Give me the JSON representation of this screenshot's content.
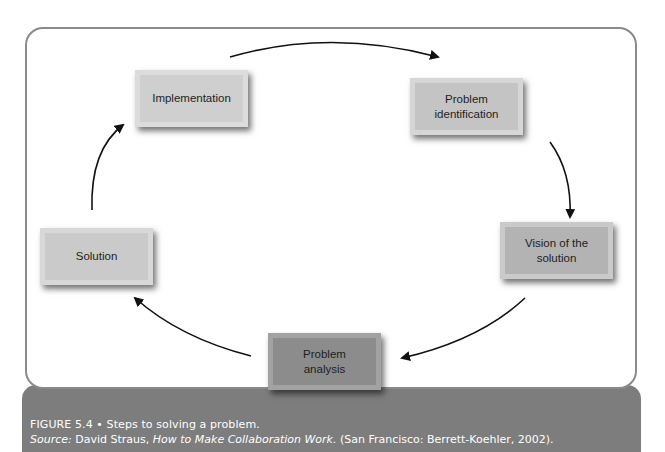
{
  "diagram": {
    "type": "cycle",
    "steps": [
      {
        "id": "problem-identification",
        "label": "Problem identification",
        "lines": [
          "Problem",
          "identification"
        ]
      },
      {
        "id": "vision",
        "label": "Vision of the solution",
        "lines": [
          "Vision of the",
          "solution"
        ]
      },
      {
        "id": "problem-analysis",
        "label": "Problem analysis",
        "lines": [
          "Problem",
          "analysis"
        ]
      },
      {
        "id": "solution",
        "label": "Solution",
        "lines": [
          "Solution"
        ]
      },
      {
        "id": "implementation",
        "label": "Implementation",
        "lines": [
          "Implementation"
        ]
      }
    ],
    "edges": [
      {
        "from": "implementation",
        "to": "problem-identification"
      },
      {
        "from": "problem-identification",
        "to": "vision"
      },
      {
        "from": "vision",
        "to": "problem-analysis"
      },
      {
        "from": "problem-analysis",
        "to": "solution"
      },
      {
        "from": "solution",
        "to": "implementation"
      }
    ]
  },
  "caption": {
    "figure_number": "FIGURE 5.4",
    "separator": "•",
    "title": "Steps to solving a problem.",
    "source_label": "Source:",
    "source_author": "David Straus,",
    "source_work": "How to Make Collaboration Work.",
    "source_pub": "(San Francisco: Berrett-Koehler, 2002)."
  },
  "colors": {
    "frame_border": "#8a8a8a",
    "caption_bg": "#7d7d7d",
    "caption_text": "#ffffff",
    "arrow": "#111111"
  }
}
